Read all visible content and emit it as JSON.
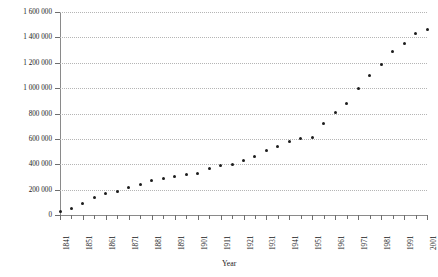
{
  "chart_data": {
    "type": "scatter",
    "title": "",
    "xlabel": "Year",
    "ylabel": "No. of persons",
    "xlim": [
      1841,
      2001
    ],
    "ylim": [
      0,
      1600000
    ],
    "grid": true,
    "legend": "none",
    "y_tick_labels": [
      "1 600 000",
      "1 400 000",
      "1 200 000",
      "1 000 000",
      "800 000",
      "600 000",
      "400 000",
      "200 000",
      "0"
    ],
    "y_tick_values": [
      1600000,
      1400000,
      1200000,
      1000000,
      800000,
      600000,
      400000,
      200000,
      0
    ],
    "x_tick_labels": [
      "1841",
      "1851",
      "1861",
      "1871",
      "1881",
      "1891",
      "1901",
      "1911",
      "1921",
      "1931",
      "1941",
      "1951",
      "1961",
      "1971",
      "1981",
      "1991",
      "2001"
    ],
    "x_tick_values": [
      1841,
      1851,
      1861,
      1871,
      1881,
      1891,
      1901,
      1911,
      1921,
      1931,
      1941,
      1951,
      1961,
      1971,
      1981,
      1991,
      2001
    ],
    "x_minor_tick_interval": 5,
    "marker_color": "#1c1c1c",
    "grid_color": "#b5b5b5",
    "axis_color": "#8a8a8a",
    "x": [
      1841,
      1846,
      1851,
      1856,
      1861,
      1866,
      1871,
      1876,
      1881,
      1886,
      1891,
      1896,
      1901,
      1906,
      1911,
      1916,
      1921,
      1926,
      1931,
      1936,
      1941,
      1946,
      1951,
      1956,
      1961,
      1966,
      1971,
      1976,
      1981,
      1986,
      1991,
      1996,
      2001
    ],
    "y": [
      25000,
      55000,
      90000,
      140000,
      170000,
      185000,
      215000,
      240000,
      270000,
      285000,
      305000,
      320000,
      330000,
      370000,
      390000,
      400000,
      430000,
      460000,
      510000,
      540000,
      580000,
      600000,
      610000,
      720000,
      810000,
      880000,
      1000000,
      1100000,
      1185000,
      1290000,
      1350000,
      1430000,
      1465000
    ]
  }
}
